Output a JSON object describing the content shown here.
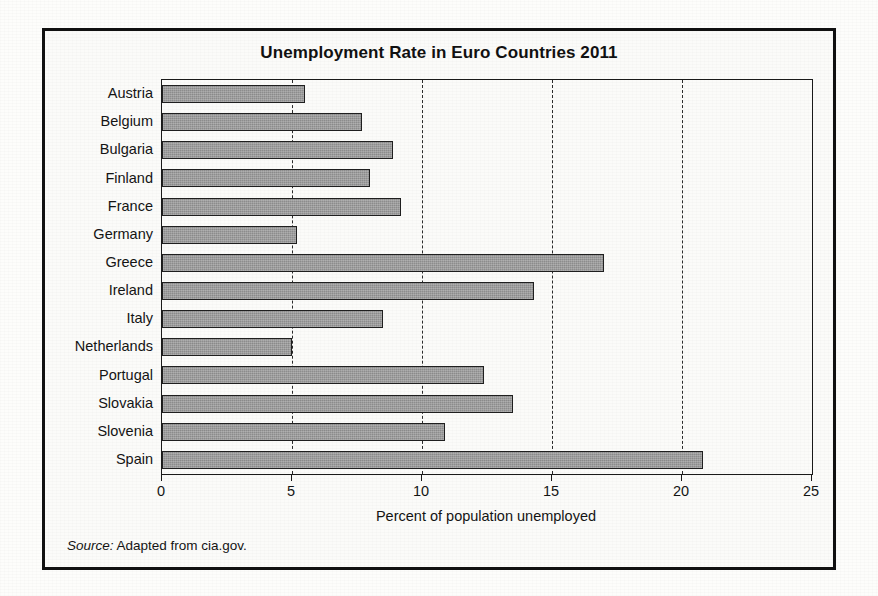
{
  "figure": {
    "title": "Unemployment Rate in Euro Countries 2011",
    "source_word": "Source:",
    "source_text": " Adapted from cia.gov."
  },
  "colors": {
    "bar_fill": "#8d8d8d",
    "bar_stroke": "#1f1f1f",
    "axis": "#1a1a1a",
    "text": "#141414",
    "page_background": "#fdfdfb",
    "frame": "#111111"
  },
  "chart_data": {
    "type": "bar",
    "orientation": "horizontal",
    "title": "Unemployment Rate in Euro Countries 2011",
    "xlabel": "Percent of population unemployed",
    "ylabel": "",
    "xlim": [
      0,
      25
    ],
    "xticks": [
      0,
      5,
      10,
      15,
      20,
      25
    ],
    "xtick_labels": [
      "0",
      "5",
      "10",
      "15",
      "20",
      "25"
    ],
    "grid": "vertical-dashed-at-5-10-15-20",
    "legend": "none",
    "categories": [
      "Austria",
      "Belgium",
      "Bulgaria",
      "Finland",
      "France",
      "Germany",
      "Greece",
      "Ireland",
      "Italy",
      "Netherlands",
      "Portugal",
      "Slovakia",
      "Slovenia",
      "Spain"
    ],
    "values": [
      5.5,
      7.7,
      8.9,
      8.0,
      9.2,
      5.2,
      17.0,
      14.3,
      8.5,
      5.0,
      12.4,
      13.5,
      10.9,
      20.8
    ],
    "units": "percent"
  }
}
